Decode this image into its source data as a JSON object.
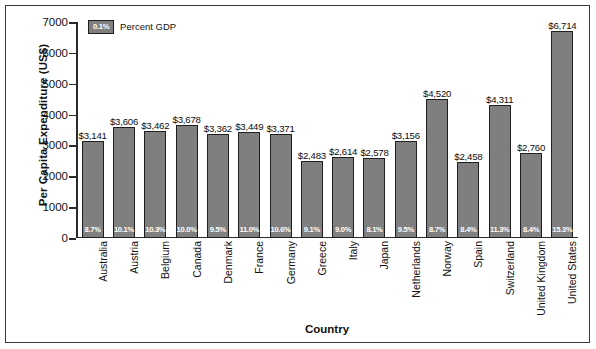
{
  "chart_data": {
    "type": "bar",
    "title": "",
    "xlabel": "Country",
    "ylabel": "Per Capita Expenditure (US$)",
    "ylim": [
      0,
      7000
    ],
    "ytick_labels": [
      "7000",
      "6000",
      "5000",
      "4000",
      "3000",
      "2000",
      "1000",
      "0"
    ],
    "ytick_values": [
      7000,
      6000,
      5000,
      4000,
      3000,
      2000,
      1000,
      0
    ],
    "grid": false,
    "legend": {
      "position": "top-left",
      "swatch_text": "0.1%",
      "label": "Percent GDP"
    },
    "bar_color": "#7f7f7f",
    "bar_edge_color": "#1f1f1f",
    "categories": [
      "Australia",
      "Austria",
      "Belgium",
      "Canada",
      "Denmark",
      "France",
      "Germany",
      "Greece",
      "Italy",
      "Japan",
      "Netherlands",
      "Norway",
      "Spain",
      "Switzerland",
      "United Kingdom",
      "United States"
    ],
    "values": [
      3141,
      3606,
      3462,
      3678,
      3362,
      3449,
      3371,
      2483,
      2614,
      2578,
      3156,
      4520,
      2458,
      4311,
      2760,
      6714
    ],
    "value_labels": [
      "$3,141",
      "$3,606",
      "$3,462",
      "$3,678",
      "$3,362",
      "$3,449",
      "$3,371",
      "$2,483",
      "$2,614",
      "$2,578",
      "$3,156",
      "$4,520",
      "$2,458",
      "$4,311",
      "$2,760",
      "$6,714"
    ],
    "percent_gdp": [
      8.7,
      10.1,
      10.3,
      10.0,
      9.5,
      11.0,
      10.6,
      9.1,
      9.0,
      8.1,
      9.5,
      8.7,
      8.4,
      11.3,
      8.4,
      15.3
    ],
    "percent_gdp_labels": [
      "8.7%",
      "10.1%",
      "10.3%",
      "10.0%",
      "9.5%",
      "11.0%",
      "10.6%",
      "9.1%",
      "9.0%",
      "8.1%",
      "9.5%",
      "8.7%",
      "8.4%",
      "11.3%",
      "8.4%",
      "15.3%"
    ]
  }
}
